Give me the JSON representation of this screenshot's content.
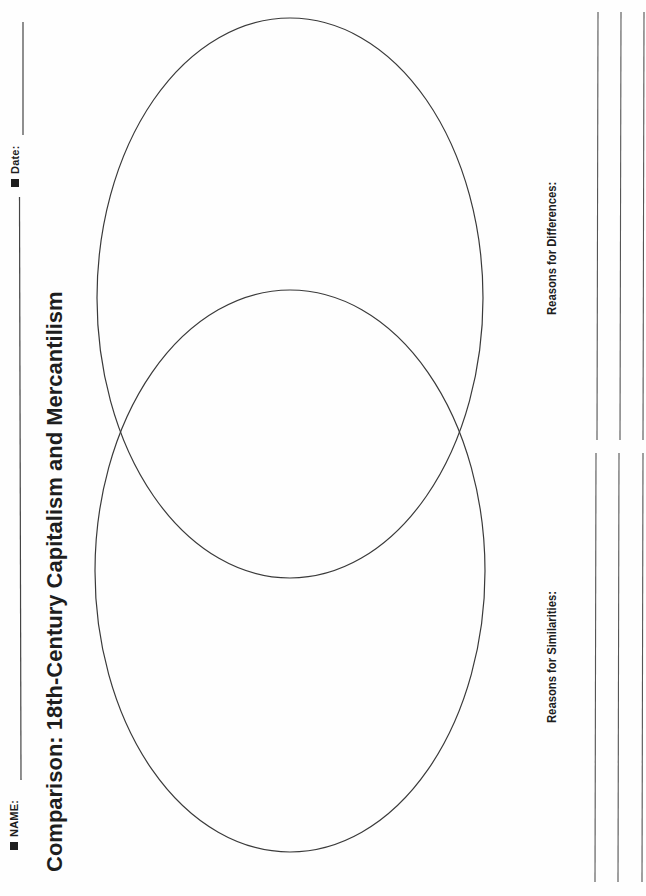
{
  "header": {
    "name_label": "NAME:",
    "date_label": "Date:",
    "bullet_icon": "square-bullet"
  },
  "title": "Comparison: 18th-Century Capitalism and Mercantilism",
  "venn": {
    "circles": [
      {
        "id": "top",
        "cx": 290,
        "cy": 298,
        "rx": 193,
        "ry": 280,
        "label": ""
      },
      {
        "id": "bottom",
        "cx": 290,
        "cy": 571,
        "rx": 195,
        "ry": 281,
        "label": ""
      }
    ],
    "stroke_color": "#3a3a3a"
  },
  "sections": {
    "similarities": {
      "label": "Reasons for Similarities:",
      "lines": 3
    },
    "differences": {
      "label": "Reasons for Differences:",
      "lines": 3
    }
  },
  "colors": {
    "ink": "#1e1e1e",
    "line": "#555555",
    "paper": "#fefefe"
  }
}
